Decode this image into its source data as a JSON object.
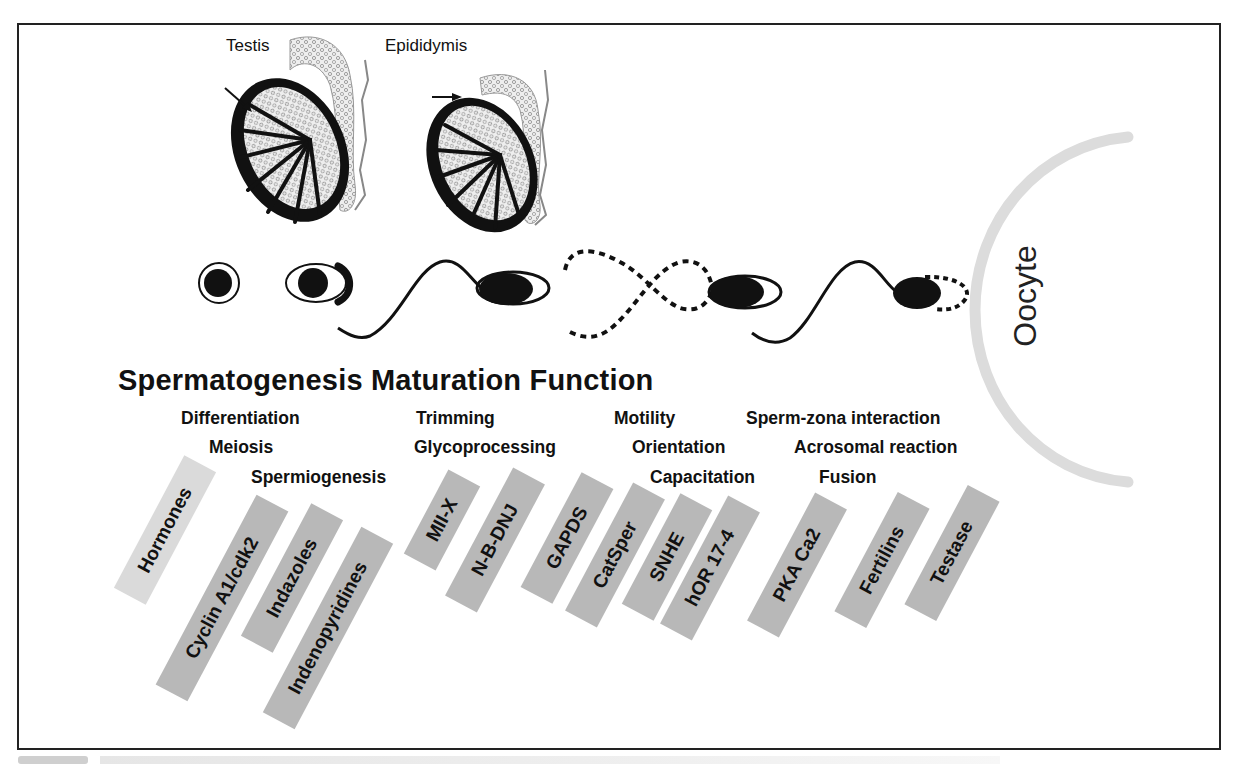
{
  "figure": {
    "organ_labels": {
      "testis": "Testis",
      "epididymis": "Epididymis"
    },
    "oocyte_label": "Oocyte",
    "stages_title": "Spermatogenesis Maturation Function",
    "processes": {
      "spermatogenesis": [
        "Differentiation",
        "Meiosis",
        "Spermiogenesis"
      ],
      "maturation": [
        "Trimming",
        "Glycoprocessing"
      ],
      "function_motility": [
        "Motility",
        "Orientation",
        "Capacitation"
      ],
      "function_fertilization": [
        "Sperm-zona interaction",
        "Acrosomal reaction",
        "Fusion"
      ]
    },
    "targets": [
      {
        "label": "Hormones",
        "shade": "light"
      },
      {
        "label": "Cyclin A1/cdk2",
        "shade": "dark"
      },
      {
        "label": "Indazoles",
        "shade": "dark"
      },
      {
        "label": "Indenopyridines",
        "shade": "dark"
      },
      {
        "label": "MII-X",
        "shade": "dark"
      },
      {
        "label": "N-B-DNJ",
        "shade": "dark"
      },
      {
        "label": "GAPDS",
        "shade": "dark"
      },
      {
        "label": "CatSper",
        "shade": "dark"
      },
      {
        "label": "SNHE",
        "shade": "dark"
      },
      {
        "label": "hOR 17-4",
        "shade": "dark"
      },
      {
        "label": "PKA Ca2",
        "shade": "dark"
      },
      {
        "label": "Fertilins",
        "shade": "dark"
      },
      {
        "label": "Testase",
        "shade": "dark"
      }
    ],
    "colors": {
      "tag_dark": "#b8b8b8",
      "tag_light": "#dadada",
      "oocyte_arc": "#dcdcdc",
      "ink": "#111111"
    }
  }
}
